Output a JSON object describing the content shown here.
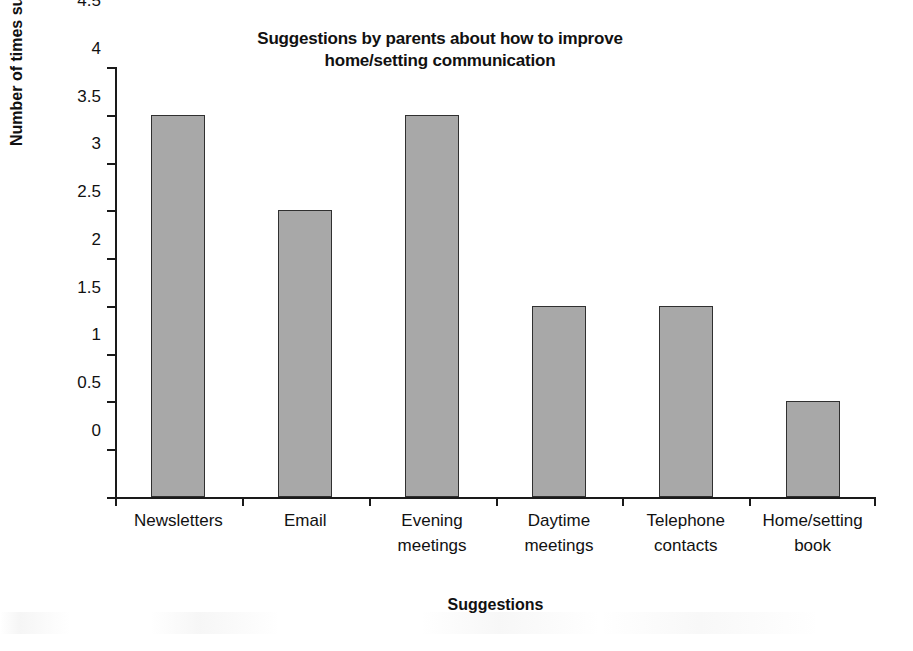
{
  "chart_data": {
    "type": "bar",
    "title": "Suggestions by parents about how to improve home/setting communication",
    "title_lines": [
      "Suggestions by parents about how to improve",
      "home/setting communication"
    ],
    "xlabel": "Suggestions",
    "ylabel": "Number of times suggested",
    "categories": [
      "Newsletters",
      "Email",
      "Evening meetings",
      "Daytime meetings",
      "Telephone contacts",
      "Home/setting book"
    ],
    "category_lines": [
      [
        "Newsletters"
      ],
      [
        "Email"
      ],
      [
        "Evening",
        "meetings"
      ],
      [
        "Daytime",
        "meetings"
      ],
      [
        "Telephone",
        "contacts"
      ],
      [
        "Home/setting",
        "book"
      ]
    ],
    "values": [
      4,
      3,
      4,
      2,
      2,
      1
    ],
    "ylim": [
      0,
      4.5
    ],
    "ytick_values": [
      0,
      0.5,
      1,
      1.5,
      2,
      2.5,
      3,
      3.5,
      4,
      4.5
    ],
    "ytick_labels": [
      "0",
      "0.5",
      "1",
      "1.5",
      "2",
      "2.5",
      "3",
      "3.5",
      "4",
      "4.5"
    ],
    "grid": false,
    "legend": false,
    "legend_position": "none",
    "bar_fill_color": "#a8a8a8",
    "bar_border_color": "#303030",
    "axis_color": "#1a1a1a",
    "background_color": "#ffffff"
  }
}
